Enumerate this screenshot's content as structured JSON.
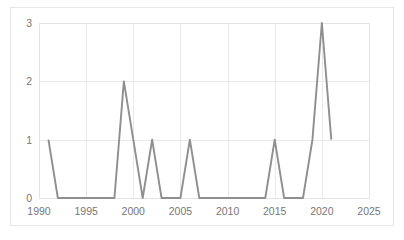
{
  "chart_data": {
    "type": "line",
    "title": "",
    "subtitle": "",
    "xlabel": "",
    "ylabel": "",
    "xlim": [
      1990,
      2025
    ],
    "ylim": [
      0,
      3
    ],
    "xticks": [
      "1990",
      "1995",
      "2000",
      "2005",
      "2010",
      "2015",
      "2020",
      "2025"
    ],
    "xtick_values": [
      1990,
      1995,
      2000,
      2005,
      2010,
      2015,
      2020,
      2025
    ],
    "yticks": [
      "0",
      "1",
      "2",
      "3"
    ],
    "ytick_values": [
      0,
      1,
      2,
      3
    ],
    "grid": true,
    "grid_axes": "both",
    "legend": false,
    "legend_position": "none",
    "line_color": "#8f8f8f",
    "grid_color": "#e9e9e9",
    "plot_border_color": "#e3e3e3",
    "frame_border_color": "#e6e6e6",
    "tick_label_color": "#777777",
    "background_color": "#ffffff",
    "x": [
      1991,
      1992,
      1993,
      1994,
      1995,
      1996,
      1997,
      1998,
      1999,
      2000,
      2001,
      2002,
      2003,
      2004,
      2005,
      2006,
      2007,
      2008,
      2009,
      2010,
      2011,
      2012,
      2013,
      2014,
      2015,
      2016,
      2017,
      2018,
      2019,
      2020,
      2021
    ],
    "values": [
      1,
      0,
      0,
      0,
      0,
      0,
      0,
      0,
      2,
      1,
      0,
      1,
      0,
      0,
      0,
      1,
      0,
      0,
      0,
      0,
      0,
      0,
      0,
      0,
      1,
      0,
      0,
      0,
      1,
      3,
      1
    ],
    "series": [
      {
        "name": "count",
        "x": [
          1991,
          1992,
          1993,
          1994,
          1995,
          1996,
          1997,
          1998,
          1999,
          2000,
          2001,
          2002,
          2003,
          2004,
          2005,
          2006,
          2007,
          2008,
          2009,
          2010,
          2011,
          2012,
          2013,
          2014,
          2015,
          2016,
          2017,
          2018,
          2019,
          2020,
          2021
        ],
        "values": [
          1,
          0,
          0,
          0,
          0,
          0,
          0,
          0,
          2,
          1,
          0,
          1,
          0,
          0,
          0,
          1,
          0,
          0,
          0,
          0,
          0,
          0,
          0,
          0,
          1,
          0,
          0,
          0,
          1,
          3,
          1
        ],
        "color": "#8f8f8f"
      }
    ]
  }
}
